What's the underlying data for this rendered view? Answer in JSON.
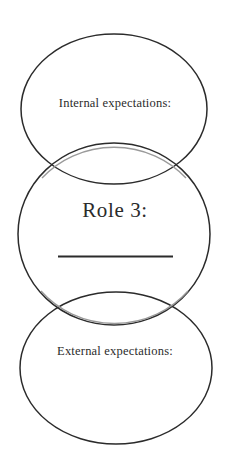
{
  "diagram": {
    "type": "venn-three-vertical-circles",
    "background_color": "#ffffff",
    "stroke_color": "#2b2b2b",
    "stroke_color_light": "#8a8a8a",
    "text_color": "#2b2b2b",
    "circles": [
      {
        "id": "top-circle",
        "name": "internal-expectations-circle",
        "cx": 114,
        "cy": 109,
        "rx": 93,
        "ry": 75,
        "label": "Internal expectations:"
      },
      {
        "id": "middle-circle",
        "name": "role-circle",
        "cx": 114,
        "cy": 234,
        "rx": 96,
        "ry": 91,
        "label": "Role 3:"
      },
      {
        "id": "bottom-circle",
        "name": "external-expectations-circle",
        "cx": 116,
        "cy": 368,
        "rx": 96,
        "ry": 76,
        "label": "External expectations:"
      }
    ],
    "labels": {
      "internal": "Internal expectations:",
      "role": "Role 3:",
      "external": "External expectations:"
    },
    "write_in_line": {
      "name": "role-write-in-line",
      "x1": 58,
      "x2": 173,
      "y": 256
    }
  }
}
